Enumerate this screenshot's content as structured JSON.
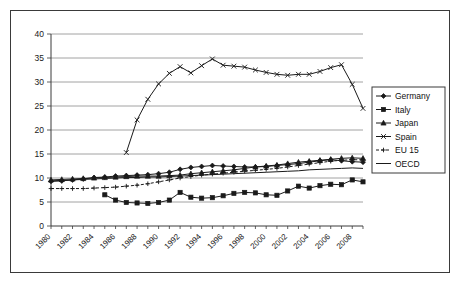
{
  "chart_data": {
    "type": "line",
    "title": "",
    "xlabel": "",
    "ylabel": "",
    "ylim": [
      0,
      40
    ],
    "ytick_step": 5,
    "yticks": [
      "0",
      "5",
      "10",
      "15",
      "20",
      "25",
      "30",
      "35",
      "40"
    ],
    "grid": "horizontal",
    "legend_position": "right-outside",
    "x": [
      1980,
      1981,
      1982,
      1983,
      1984,
      1985,
      1986,
      1987,
      1988,
      1989,
      1990,
      1991,
      1992,
      1993,
      1994,
      1995,
      1996,
      1997,
      1998,
      1999,
      2000,
      2001,
      2002,
      2003,
      2004,
      2005,
      2006,
      2007,
      2008,
      2009
    ],
    "xtick_labels": [
      "1980",
      "1982",
      "1984",
      "1986",
      "1988",
      "1990",
      "1992",
      "1994",
      "1996",
      "1998",
      "2000",
      "2002",
      "2004",
      "2006",
      "2008"
    ],
    "series": [
      {
        "name": "Germany",
        "marker": "diamond",
        "line": "solid",
        "color": "#1a1a1a",
        "values": [
          9.3,
          9.4,
          9.6,
          9.8,
          10.1,
          10.2,
          10.4,
          10.5,
          10.6,
          10.7,
          10.9,
          11.2,
          11.8,
          12.2,
          12.4,
          12.6,
          12.5,
          12.4,
          12.3,
          12.3,
          12.4,
          12.6,
          12.8,
          13.0,
          13.3,
          13.6,
          13.8,
          13.6,
          13.4,
          13.3
        ]
      },
      {
        "name": "Italy",
        "marker": "square",
        "line": "solid",
        "color": "#1a1a1a",
        "values": [
          null,
          null,
          null,
          null,
          null,
          6.5,
          5.4,
          4.9,
          4.8,
          4.7,
          4.9,
          5.4,
          7.0,
          6.0,
          5.8,
          5.9,
          6.3,
          6.8,
          7.0,
          6.9,
          6.5,
          6.4,
          7.3,
          8.3,
          7.9,
          8.4,
          8.7,
          8.6,
          9.6,
          9.2
        ]
      },
      {
        "name": "Japan",
        "marker": "triangle",
        "line": "solid",
        "color": "#1a1a1a",
        "values": [
          9.6,
          9.7,
          9.8,
          9.9,
          10.0,
          10.1,
          10.2,
          10.3,
          10.4,
          10.4,
          10.4,
          10.5,
          10.6,
          10.9,
          11.1,
          11.3,
          11.5,
          11.7,
          12.0,
          12.3,
          12.5,
          12.7,
          13.0,
          13.3,
          13.5,
          13.7,
          13.9,
          14.1,
          14.2,
          14.1
        ]
      },
      {
        "name": "Spain",
        "marker": "x",
        "line": "solid",
        "color": "#1a1a1a",
        "values": [
          null,
          null,
          null,
          null,
          null,
          null,
          null,
          15.3,
          22.1,
          26.4,
          29.6,
          31.8,
          33.2,
          31.9,
          33.4,
          34.8,
          33.5,
          33.3,
          33.1,
          32.5,
          32.0,
          31.6,
          31.4,
          31.6,
          31.6,
          32.2,
          33.0,
          33.6,
          29.5,
          24.5
        ]
      },
      {
        "name": "EU 15",
        "marker": "dash-dot",
        "line": "dashed",
        "color": "#1a1a1a",
        "values": [
          7.8,
          7.8,
          7.8,
          7.8,
          7.9,
          8.0,
          8.1,
          8.3,
          8.5,
          8.8,
          9.2,
          9.6,
          10.0,
          10.3,
          10.6,
          10.8,
          11.0,
          11.2,
          11.4,
          11.6,
          11.8,
          12.0,
          12.3,
          12.6,
          12.9,
          13.2,
          13.5,
          13.7,
          13.8,
          13.8
        ]
      },
      {
        "name": "OECD",
        "marker": "none",
        "line": "solid",
        "color": "#1a1a1a",
        "values": [
          9.4,
          9.5,
          9.6,
          9.7,
          9.8,
          9.9,
          10.0,
          10.1,
          10.1,
          10.2,
          10.2,
          10.3,
          10.4,
          10.5,
          10.6,
          10.7,
          10.8,
          10.9,
          11.0,
          11.1,
          11.2,
          11.3,
          11.4,
          11.5,
          11.7,
          11.8,
          11.9,
          12.0,
          12.1,
          12.0
        ]
      }
    ]
  },
  "legend": {
    "items": [
      {
        "label": "Germany"
      },
      {
        "label": "Italy"
      },
      {
        "label": "Japan"
      },
      {
        "label": "Spain"
      },
      {
        "label": "EU 15"
      },
      {
        "label": "OECD"
      }
    ]
  }
}
